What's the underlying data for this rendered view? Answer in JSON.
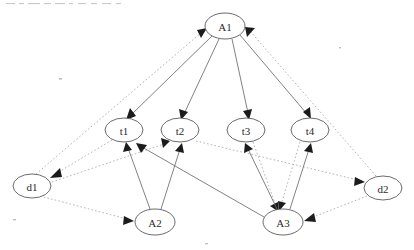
{
  "diagram": {
    "type": "node-link-diagram",
    "width": 414,
    "height": 250,
    "background_color": "#ffffff",
    "node_stroke_color": "#5a5a5a",
    "node_fill_color": "#ffffff",
    "solid_edge_color": "#6b6b6b",
    "dotted_edge_color": "#a8a8a8",
    "arrowhead_color": "#1c1c1c",
    "label_color": "#2b2b2b"
  },
  "nodes": [
    {
      "id": "A1",
      "label": "A1",
      "cx": 225,
      "cy": 26,
      "rx": 20,
      "ry": 13,
      "layer": "top"
    },
    {
      "id": "t1",
      "label": "t1",
      "cx": 124,
      "cy": 130,
      "rx": 19,
      "ry": 12,
      "layer": "middle"
    },
    {
      "id": "t2",
      "label": "t2",
      "cx": 180,
      "cy": 130,
      "rx": 19,
      "ry": 12,
      "layer": "middle"
    },
    {
      "id": "t3",
      "label": "t3",
      "cx": 246,
      "cy": 130,
      "rx": 19,
      "ry": 12,
      "layer": "middle"
    },
    {
      "id": "t4",
      "label": "t4",
      "cx": 310,
      "cy": 130,
      "rx": 19,
      "ry": 12,
      "layer": "middle"
    },
    {
      "id": "d1",
      "label": "d1",
      "cx": 32,
      "cy": 186,
      "rx": 19,
      "ry": 12,
      "layer": "left"
    },
    {
      "id": "d2",
      "label": "d2",
      "cx": 383,
      "cy": 188,
      "rx": 19,
      "ry": 12,
      "layer": "right"
    },
    {
      "id": "A2",
      "label": "A2",
      "cx": 155,
      "cy": 222,
      "rx": 20,
      "ry": 13,
      "layer": "bottom"
    },
    {
      "id": "A3",
      "label": "A3",
      "cx": 283,
      "cy": 222,
      "rx": 20,
      "ry": 13,
      "layer": "bottom"
    }
  ],
  "edges": [
    {
      "from": "A1",
      "to": "t1",
      "style": "solid",
      "arrow": "target"
    },
    {
      "from": "A1",
      "to": "t2",
      "style": "solid",
      "arrow": "target"
    },
    {
      "from": "A1",
      "to": "t3",
      "style": "solid",
      "arrow": "target"
    },
    {
      "from": "A1",
      "to": "t4",
      "style": "solid",
      "arrow": "target"
    },
    {
      "from": "A2",
      "to": "t1",
      "style": "solid",
      "arrow": "target"
    },
    {
      "from": "A2",
      "to": "t2",
      "style": "solid",
      "arrow": "target"
    },
    {
      "from": "A3",
      "to": "t3",
      "style": "solid",
      "arrow": "target"
    },
    {
      "from": "A3",
      "to": "t4",
      "style": "solid",
      "arrow": "target"
    },
    {
      "from": "A3",
      "to": "t1",
      "style": "solid",
      "arrow": "target"
    },
    {
      "from": "d1",
      "to": "A1",
      "style": "dotted",
      "arrow": "target"
    },
    {
      "from": "d2",
      "to": "A1",
      "style": "dotted",
      "arrow": "target"
    },
    {
      "from": "t1",
      "to": "d1",
      "style": "dotted",
      "arrow": "target"
    },
    {
      "from": "d1",
      "to": "t2",
      "style": "dotted",
      "arrow": "target"
    },
    {
      "from": "t2",
      "to": "d2",
      "style": "dotted",
      "arrow": "target"
    },
    {
      "from": "t3",
      "to": "A3",
      "style": "dotted",
      "arrow": "target"
    },
    {
      "from": "t4",
      "to": "A3",
      "style": "dotted",
      "arrow": "target"
    },
    {
      "from": "d1",
      "to": "A2",
      "style": "dotted",
      "arrow": "target"
    },
    {
      "from": "d2",
      "to": "A3",
      "style": "dotted",
      "arrow": "target"
    },
    {
      "from": "A3",
      "to": "d2",
      "style": "dotted",
      "arrow": "target"
    }
  ],
  "legend": {
    "solid_meaning": "solid-edge",
    "dotted_meaning": "dotted-edge"
  }
}
